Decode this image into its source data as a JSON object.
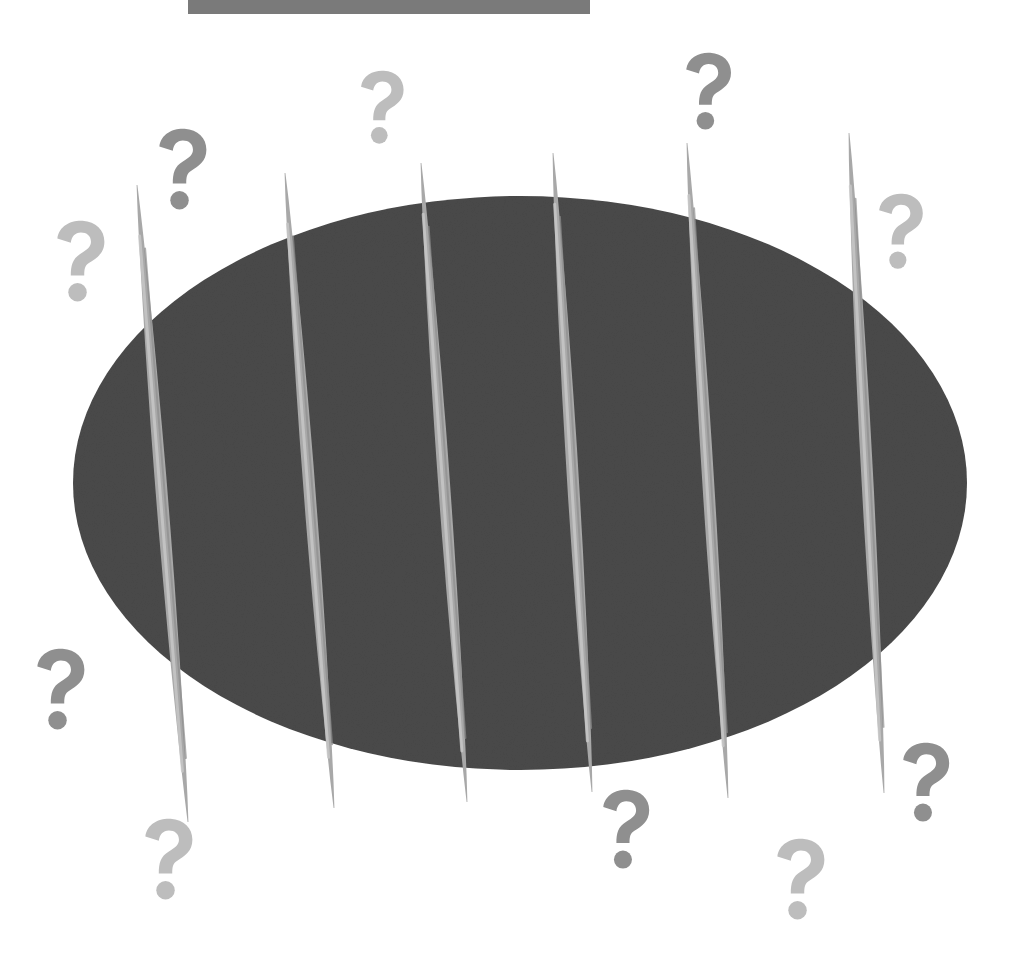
{
  "colors": {
    "background": "#ffffff",
    "top_bar": "#7a7a7a",
    "oval": "#4a4a4a",
    "toothpick_light": "#c9c9c9",
    "toothpick_mid": "#a8a8a8",
    "toothpick_dark": "#8e8e8e",
    "qmark_dark": "#8f8f8f",
    "qmark_light": "#bdbdbd"
  },
  "top_bar": {
    "x": 188,
    "y": 0,
    "w": 402,
    "h": 14
  },
  "oval": {
    "cx": 520,
    "cy": 483,
    "rx": 447,
    "ry": 287
  },
  "toothpicks": [
    {
      "x1": 137,
      "y1": 185,
      "x2": 188,
      "y2": 822
    },
    {
      "x1": 285,
      "y1": 173,
      "x2": 334,
      "y2": 808
    },
    {
      "x1": 421,
      "y1": 163,
      "x2": 467,
      "y2": 802
    },
    {
      "x1": 553,
      "y1": 153,
      "x2": 592,
      "y2": 792
    },
    {
      "x1": 687,
      "y1": 143,
      "x2": 728,
      "y2": 798
    },
    {
      "x1": 849,
      "y1": 133,
      "x2": 884,
      "y2": 793
    }
  ],
  "question_marks": [
    {
      "cx": 182,
      "cy": 170,
      "size": 84,
      "shade": "dark"
    },
    {
      "cx": 382,
      "cy": 108,
      "size": 76,
      "shade": "light"
    },
    {
      "cx": 708,
      "cy": 92,
      "size": 80,
      "shade": "dark"
    },
    {
      "cx": 900,
      "cy": 232,
      "size": 78,
      "shade": "light"
    },
    {
      "cx": 80,
      "cy": 262,
      "size": 84,
      "shade": "light"
    },
    {
      "cx": 60,
      "cy": 690,
      "size": 84,
      "shade": "dark"
    },
    {
      "cx": 168,
      "cy": 860,
      "size": 84,
      "shade": "light"
    },
    {
      "cx": 625,
      "cy": 830,
      "size": 82,
      "shade": "dark"
    },
    {
      "cx": 925,
      "cy": 783,
      "size": 82,
      "shade": "dark"
    },
    {
      "cx": 800,
      "cy": 880,
      "size": 84,
      "shade": "light"
    }
  ]
}
